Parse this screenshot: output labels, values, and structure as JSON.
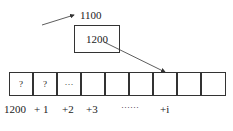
{
  "pointer_var": {
    "address": "1100",
    "value": "1200"
  },
  "array": {
    "cells": [
      "?",
      "?",
      "···",
      "",
      "",
      "",
      "",
      "",
      ""
    ],
    "labels": [
      {
        "text": "1200",
        "x": 4
      },
      {
        "text": "+ 1",
        "x": 34
      },
      {
        "text": "+2",
        "x": 62
      },
      {
        "text": "+3",
        "x": 86
      },
      {
        "text": "······",
        "x": 121
      },
      {
        "text": "+i",
        "x": 160
      }
    ]
  }
}
